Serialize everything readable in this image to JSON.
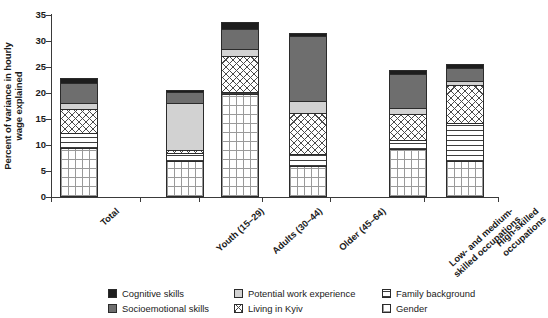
{
  "chart_data": {
    "type": "bar",
    "stacked": true,
    "title": "",
    "xlabel": "",
    "ylabel": "Percent of variance in hourly wage explained",
    "ylim": [
      0,
      35
    ],
    "yticks": [
      0,
      5,
      10,
      15,
      20,
      25,
      30,
      35
    ],
    "grid": false,
    "legend_position": "bottom",
    "categories": [
      "Total",
      "Youth (15–29)",
      "Adults (30–44)",
      "Older (45–64)",
      "Low- and medium-skilled occupations",
      "High-skilled occupations"
    ],
    "category_lines": [
      [
        "Total"
      ],
      [
        "Youth (15–29)"
      ],
      [
        "Adults (30–44)"
      ],
      [
        "Older (45–64)"
      ],
      [
        "Low- and medium-",
        "skilled occupations"
      ],
      [
        "High-skilled",
        "occupations"
      ]
    ],
    "series": [
      {
        "name": "Gender",
        "key": "gen",
        "swatch": "#ffffff",
        "pattern": "fine-grid",
        "values": [
          9.4,
          6.9,
          19.8,
          6.0,
          9.2,
          6.9
        ]
      },
      {
        "name": "Family background",
        "key": "fam",
        "swatch": "#ffffff",
        "pattern": "horizontal-lines",
        "values": [
          2.9,
          1.5,
          0.3,
          2.2,
          1.7,
          7.3
        ]
      },
      {
        "name": "Living in Kyiv",
        "key": "kyiv",
        "swatch": "#ffffff",
        "pattern": "cross-hatch",
        "values": [
          4.6,
          0.6,
          7.1,
          7.9,
          5.0,
          7.3
        ]
      },
      {
        "name": "Potential work experience",
        "key": "pot",
        "swatch": "#d2d2d2",
        "pattern": "solid",
        "values": [
          1.2,
          9.0,
          1.3,
          2.4,
          1.2,
          0.9
        ]
      },
      {
        "name": "Socioemotional skills",
        "key": "soc",
        "swatch": "#6e6e6e",
        "pattern": "solid",
        "values": [
          3.8,
          2.1,
          3.8,
          12.5,
          6.5,
          2.5
        ]
      },
      {
        "name": "Cognitive skills",
        "key": "cog",
        "swatch": "#1d1d1d",
        "pattern": "solid",
        "values": [
          1.0,
          0.5,
          1.4,
          0.6,
          0.8,
          0.7
        ]
      }
    ],
    "totals": [
      22.9,
      20.6,
      33.7,
      31.6,
      24.4,
      25.6
    ]
  },
  "legend": {
    "items": [
      {
        "label": "Cognitive skills"
      },
      {
        "label": "Potential work experience"
      },
      {
        "label": "Family background"
      },
      {
        "label": "Socioemotional skills"
      },
      {
        "label": "Living in Kyiv"
      },
      {
        "label": "Gender"
      }
    ]
  },
  "axis": {
    "y_title_line1": "Percent of variance in hourly",
    "y_title_line2": "wage explained"
  }
}
